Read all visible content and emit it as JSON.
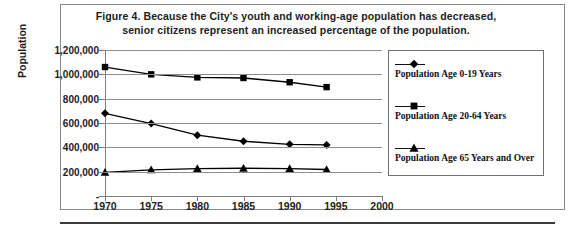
{
  "figure": {
    "title_line1": "Figure 4. Because the City's youth and working-age population has decreased,",
    "title_line2": "senior citizens represent an increased percentage of the population."
  },
  "axes": {
    "y_title": "Population",
    "y_ticks": [
      "1,200,000",
      "1,000,000",
      "800,000",
      "600,000",
      "400,000",
      "200,000",
      "-"
    ],
    "x_ticks": [
      "1970",
      "1975",
      "1980",
      "1985",
      "1990",
      "1995",
      "2000"
    ]
  },
  "legend": {
    "items": [
      {
        "label": "Population Age 0-19 Years",
        "marker": "diamond"
      },
      {
        "label": "Population Age 20-64 Years",
        "marker": "square"
      },
      {
        "label": "Population Age 65 Years and Over",
        "marker": "triangle"
      }
    ]
  },
  "chart_data": {
    "type": "line",
    "title": "Figure 4. Because the City's youth and working-age population has decreased, senior citizens represent an increased percentage of the population.",
    "xlabel": "",
    "ylabel": "Population",
    "xlim": [
      1970,
      2000
    ],
    "ylim": [
      0,
      1200000
    ],
    "yticks": [
      0,
      200000,
      400000,
      600000,
      800000,
      1000000,
      1200000
    ],
    "ytick_labels": [
      "-",
      "200,000",
      "400,000",
      "600,000",
      "800,000",
      "1,000,000",
      "1,200,000"
    ],
    "xticks": [
      1970,
      1975,
      1980,
      1985,
      1990,
      1995,
      2000
    ],
    "grid": "horizontal",
    "legend_position": "right",
    "x": [
      1970,
      1975,
      1980,
      1985,
      1990,
      1994
    ],
    "series": [
      {
        "name": "Population Age 0-19 Years",
        "marker": "diamond",
        "color": "#000000",
        "values": [
          680000,
          595000,
          500000,
          450000,
          425000,
          420000
        ]
      },
      {
        "name": "Population Age 20-64 Years",
        "marker": "square",
        "color": "#000000",
        "values": [
          1060000,
          1000000,
          975000,
          970000,
          935000,
          895000
        ]
      },
      {
        "name": "Population Age 65 Years and Over",
        "marker": "triangle",
        "color": "#000000",
        "values": [
          195000,
          215000,
          225000,
          228000,
          225000,
          218000
        ]
      }
    ]
  }
}
